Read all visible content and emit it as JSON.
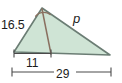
{
  "figure": {
    "kind": "triangle-with-cevian",
    "colors": {
      "fill": "#cfe4d5",
      "stroke": "#6b7d74",
      "cevian": "#8a7060",
      "arc": "#8a7060",
      "measure": "#4a4a4a",
      "text": "#1b1b1b",
      "background": "#ffffff"
    },
    "labels": {
      "side_left": "16.5",
      "side_right": "p",
      "segment_short": "11",
      "segment_full": "29"
    },
    "icons": {
      "angle_arc": "angle-bisector-arc-icon",
      "measure_left": "measure-bar-11-icon",
      "measure_full": "measure-bar-29-icon"
    },
    "geometry": {
      "apex": [
        42,
        8
      ],
      "left_vertex": [
        14,
        52
      ],
      "right_vertex": [
        110,
        55
      ],
      "cevian_foot": [
        51,
        54
      ],
      "measure_short": {
        "y": 53,
        "x1": 14,
        "x2": 51
      },
      "measure_full": {
        "y": 72,
        "x1": 12,
        "x2": 111
      }
    }
  }
}
